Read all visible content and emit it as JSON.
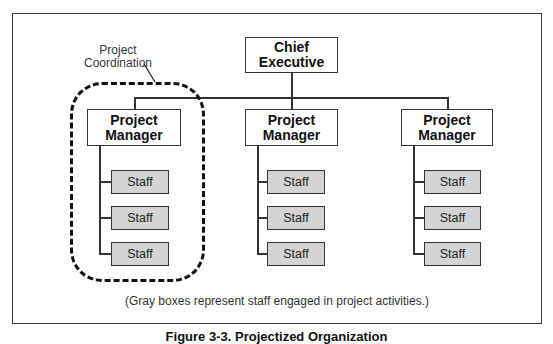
{
  "diagram": {
    "type": "org-chart",
    "top": {
      "label": "Chief\nExecutive",
      "line1": "Chief",
      "line2": "Executive"
    },
    "branches": [
      {
        "manager": {
          "line1": "Project",
          "line2": "Manager"
        },
        "staff": [
          "Staff",
          "Staff",
          "Staff"
        ],
        "highlighted": true
      },
      {
        "manager": {
          "line1": "Project",
          "line2": "Manager"
        },
        "staff": [
          "Staff",
          "Staff",
          "Staff"
        ],
        "highlighted": false
      },
      {
        "manager": {
          "line1": "Project",
          "line2": "Manager"
        },
        "staff": [
          "Staff",
          "Staff",
          "Staff"
        ],
        "highlighted": false
      }
    ],
    "annotation": {
      "line1": "Project",
      "line2": "Coordination"
    },
    "footnote": "(Gray boxes represent staff engaged in project activities.)",
    "caption": "Figure 3-3. Projectized Organization",
    "colors": {
      "staff_fill": "#d4d4d4",
      "border": "#333333",
      "background": "#ffffff"
    }
  }
}
